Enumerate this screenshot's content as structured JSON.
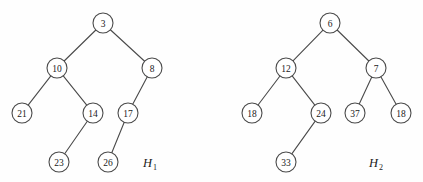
{
  "figure": {
    "background_color": "#fefefe",
    "stroke_color": "#4a4a4a",
    "node_fill_color": "#ffffff",
    "text_color": "#1a1a1a",
    "node_radius": 10,
    "width": 423,
    "height": 182
  },
  "trees": [
    {
      "id": "H1",
      "name_letter": "H",
      "name_subscript": "1",
      "label_x": 150,
      "label_y": 163,
      "nodes": [
        {
          "id": "h1-n3",
          "value": "3",
          "x": 103,
          "y": 23,
          "level": 0
        },
        {
          "id": "h1-n10",
          "value": "10",
          "x": 57,
          "y": 68,
          "level": 1
        },
        {
          "id": "h1-n8",
          "value": "8",
          "x": 152,
          "y": 68,
          "level": 1
        },
        {
          "id": "h1-n21",
          "value": "21",
          "x": 22,
          "y": 113,
          "level": 2
        },
        {
          "id": "h1-n14",
          "value": "14",
          "x": 93,
          "y": 113,
          "level": 2
        },
        {
          "id": "h1-n17",
          "value": "17",
          "x": 128,
          "y": 113,
          "level": 2
        },
        {
          "id": "h1-n23",
          "value": "23",
          "x": 59,
          "y": 162,
          "level": 3
        },
        {
          "id": "h1-n26",
          "value": "26",
          "x": 108,
          "y": 162,
          "level": 3
        }
      ],
      "edges": [
        {
          "from": "h1-n3",
          "to": "h1-n10"
        },
        {
          "from": "h1-n3",
          "to": "h1-n8"
        },
        {
          "from": "h1-n10",
          "to": "h1-n21"
        },
        {
          "from": "h1-n10",
          "to": "h1-n14"
        },
        {
          "from": "h1-n8",
          "to": "h1-n17"
        },
        {
          "from": "h1-n14",
          "to": "h1-n23"
        },
        {
          "from": "h1-n17",
          "to": "h1-n26"
        }
      ]
    },
    {
      "id": "H2",
      "name_letter": "H",
      "name_subscript": "2",
      "label_x": 376,
      "label_y": 163,
      "nodes": [
        {
          "id": "h2-n6",
          "value": "6",
          "x": 330,
          "y": 23,
          "level": 0
        },
        {
          "id": "h2-n12",
          "value": "12",
          "x": 286,
          "y": 68,
          "level": 1
        },
        {
          "id": "h2-n7",
          "value": "7",
          "x": 376,
          "y": 68,
          "level": 1
        },
        {
          "id": "h2-n18a",
          "value": "18",
          "x": 252,
          "y": 113,
          "level": 2
        },
        {
          "id": "h2-n24",
          "value": "24",
          "x": 321,
          "y": 113,
          "level": 2
        },
        {
          "id": "h2-n37",
          "value": "37",
          "x": 355,
          "y": 113,
          "level": 2
        },
        {
          "id": "h2-n18b",
          "value": "18",
          "x": 401,
          "y": 113,
          "level": 2
        },
        {
          "id": "h2-n33",
          "value": "33",
          "x": 286,
          "y": 162,
          "level": 3
        }
      ],
      "edges": [
        {
          "from": "h2-n6",
          "to": "h2-n12"
        },
        {
          "from": "h2-n6",
          "to": "h2-n7"
        },
        {
          "from": "h2-n12",
          "to": "h2-n18a"
        },
        {
          "from": "h2-n12",
          "to": "h2-n24"
        },
        {
          "from": "h2-n7",
          "to": "h2-n37"
        },
        {
          "from": "h2-n7",
          "to": "h2-n18b"
        },
        {
          "from": "h2-n24",
          "to": "h2-n33"
        }
      ]
    }
  ]
}
